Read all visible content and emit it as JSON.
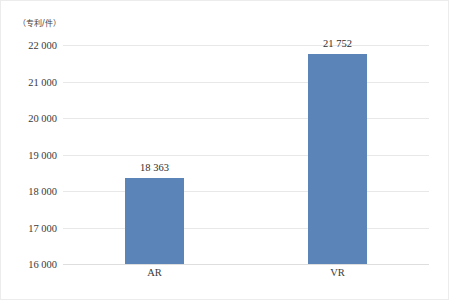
{
  "chart_data": {
    "type": "bar",
    "title": "",
    "subtitle": "",
    "xlabel": "",
    "ylabel": "（专利/件）",
    "categories": [
      "AR",
      "VR"
    ],
    "values": [
      18363,
      21752
    ],
    "value_labels": [
      "18 363",
      "21 752"
    ],
    "series": [
      {
        "name": "",
        "values": [
          18363,
          21752
        ]
      }
    ],
    "ylim": [
      16000,
      22000
    ],
    "ytick_values": [
      16000,
      17000,
      18000,
      19000,
      20000,
      21000,
      22000
    ],
    "ytick_labels": [
      "16 000",
      "17 000",
      "18 000",
      "19 000",
      "20 000",
      "21 000",
      "22 000"
    ],
    "grid": true,
    "grid_axis": "y",
    "legend": false,
    "legend_position": "none",
    "bar_color": "#5b84b8",
    "grid_color": "#e8e8e8",
    "background_color": "#ffffff",
    "text_color": "#3a3a3a",
    "annotations": []
  },
  "figure": {
    "axis_unit_caption": "（专利/件）",
    "border_color": "#ececed"
  }
}
